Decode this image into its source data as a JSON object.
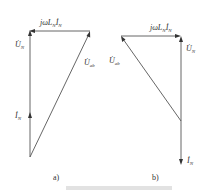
{
  "diagrams": [
    {
      "id": "a",
      "label": "a)",
      "phasors": {
        "voltage_drop": {
          "prefix": "jωL",
          "sub1": "N",
          "phasor": "İ",
          "sub2": "N"
        },
        "u_n": {
          "symbol": "U̇",
          "sub": "N"
        },
        "u_ab": {
          "symbol": "U̇",
          "sub": "ab"
        },
        "i_n": {
          "symbol": "İ",
          "sub": "N"
        }
      }
    },
    {
      "id": "b",
      "label": "b)",
      "phasors": {
        "voltage_drop": {
          "prefix": "jωL",
          "sub1": "N",
          "phasor": "İ",
          "sub2": "N"
        },
        "u_n": {
          "symbol": "U̇",
          "sub": "N"
        },
        "u_ab": {
          "symbol": "U̇",
          "sub": "ab"
        },
        "i_n": {
          "symbol": "İ",
          "sub": "N"
        }
      }
    }
  ],
  "caption": ""
}
